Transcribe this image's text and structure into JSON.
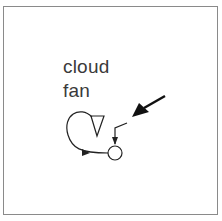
{
  "figure": {
    "labels": {
      "line1": "cloud",
      "line2": "fan"
    },
    "elements": [
      {
        "type": "triangle",
        "role": "fan-symbol",
        "orientation": "down"
      },
      {
        "type": "loop-arrow",
        "role": "feedback-loop"
      },
      {
        "type": "circle",
        "role": "node"
      },
      {
        "type": "bent-arrow",
        "role": "input-arrow"
      },
      {
        "type": "bold-arrow",
        "role": "pointer-arrow"
      }
    ],
    "colors": {
      "stroke": "#222222",
      "text": "#3a3a3a",
      "frame": "#8a8a8a"
    }
  }
}
